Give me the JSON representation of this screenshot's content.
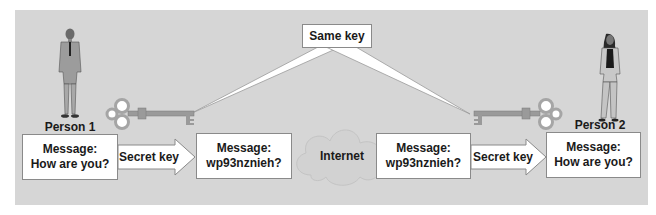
{
  "diagram": {
    "colors": {
      "background": "#d6d6d6",
      "box_fill": "#ffffff",
      "box_border": "#8a8a8a",
      "text": "#1a1a1a",
      "key_metal": "#9a9a9a"
    },
    "shared_key_label": "Same key",
    "channel_label": "Internet",
    "sender": {
      "label": "Person 1",
      "plaintext": {
        "title": "Message:",
        "body": "How are you?"
      },
      "operation_label": "Secret key",
      "ciphertext": {
        "title": "Message:",
        "body": "wp93nznieh?"
      }
    },
    "receiver": {
      "label": "Person 2",
      "ciphertext": {
        "title": "Message:",
        "body": "wp93nznieh?"
      },
      "operation_label": "Secret key",
      "plaintext": {
        "title": "Message:",
        "body": "How are you?"
      }
    },
    "icons": [
      "person-man-icon",
      "person-woman-icon",
      "key-icon",
      "key-icon",
      "cloud-icon",
      "arrow-right-icon"
    ]
  }
}
